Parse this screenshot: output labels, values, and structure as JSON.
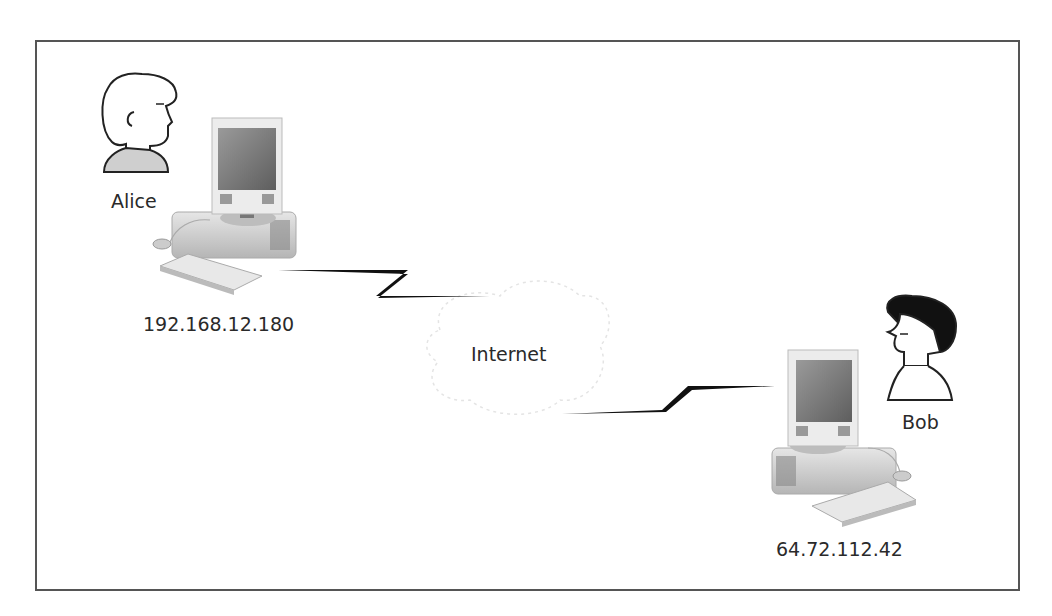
{
  "diagram": {
    "type": "network-diagram",
    "nodes": [
      {
        "id": "alice",
        "person_label": "Alice",
        "ip": "192.168.12.180",
        "hair_color": "#ffffff"
      },
      {
        "id": "internet",
        "label": "Internet"
      },
      {
        "id": "bob",
        "person_label": "Bob",
        "ip": "64.72.112.42",
        "hair_color": "#111111"
      }
    ],
    "edges": [
      {
        "from": "alice",
        "to": "internet",
        "style": "lightning-bolt"
      },
      {
        "from": "internet",
        "to": "bob",
        "style": "lightning-bolt"
      }
    ]
  },
  "labels": {
    "alice": "Alice",
    "alice_ip": "192.168.12.180",
    "internet": "Internet",
    "bob": "Bob",
    "bob_ip": "64.72.112.42"
  }
}
